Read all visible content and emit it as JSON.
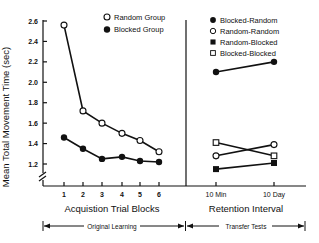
{
  "chart_data": [
    {
      "type": "line",
      "title": "",
      "xlabel": "Acquistion Trial Blocks",
      "ylabel": "Mean Total Movement Time (sec)",
      "categories": [
        "1",
        "2",
        "3",
        "4",
        "5",
        "6"
      ],
      "ylim": [
        1.0,
        2.6
      ],
      "yticks": [
        2.6,
        2.4,
        2.2,
        2.0,
        1.8,
        1.6,
        1.4,
        1.2
      ],
      "axis_break": true,
      "grid": false,
      "legend_position": "top-right",
      "series": [
        {
          "name": "Random Group",
          "marker": "open-circle",
          "values": [
            2.56,
            1.72,
            1.6,
            1.5,
            1.43,
            1.32
          ]
        },
        {
          "name": "Blocked Group",
          "marker": "filled-circle",
          "values": [
            1.46,
            1.35,
            1.25,
            1.27,
            1.23,
            1.22
          ]
        }
      ],
      "span_label": "Original Learning"
    },
    {
      "type": "line",
      "title": "",
      "xlabel": "Retention Interval",
      "ylabel": "",
      "categories": [
        "10 Min",
        "10 Day"
      ],
      "ylim": [
        1.0,
        2.6
      ],
      "grid": false,
      "legend_position": "top",
      "series": [
        {
          "name": "Blocked-Random",
          "marker": "filled-circle",
          "values": [
            2.1,
            2.2
          ]
        },
        {
          "name": "Random-Random",
          "marker": "open-circle",
          "values": [
            1.28,
            1.39
          ]
        },
        {
          "name": "Random-Blocked",
          "marker": "filled-square",
          "values": [
            1.15,
            1.21
          ]
        },
        {
          "name": "Blocked-Blocked",
          "marker": "open-square",
          "values": [
            1.41,
            1.28
          ]
        }
      ],
      "span_label": "Transfer Tests"
    }
  ],
  "labels": {
    "ylabel": "Mean Total Movement Time (sec)",
    "left_xlabel": "Acquistion Trial Blocks",
    "right_xlabel": "Retention Interval",
    "left_span": "Original Learning",
    "right_span": "Transfer Tests",
    "yticks": [
      "2.6",
      "2.4",
      "2.2",
      "2.0",
      "1.8",
      "1.6",
      "1.4",
      "1.2"
    ],
    "left_xticks": [
      "1",
      "2",
      "3",
      "4",
      "5",
      "6"
    ],
    "right_xticks": [
      "10 Min",
      "10 Day"
    ],
    "left_legend": [
      "Random Group",
      "Blocked Group"
    ],
    "right_legend": [
      "Blocked-Random",
      "Random-Random",
      "Random-Blocked",
      "Blocked-Blocked"
    ]
  },
  "colors": {
    "ink": "#111111",
    "background": "#ffffff"
  }
}
